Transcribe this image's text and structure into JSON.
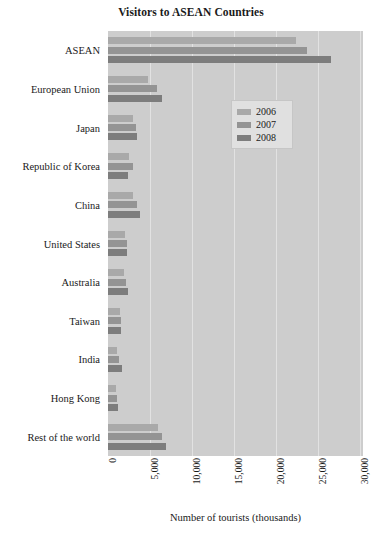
{
  "chart_data": {
    "type": "bar",
    "orientation": "horizontal",
    "title": "Visitors to ASEAN Countries",
    "xlabel": "Number of tourists (thousands)",
    "ylabel": "",
    "xlim": [
      0,
      30400
    ],
    "xticks": [
      "0",
      "5,000",
      "10,000",
      "15,000",
      "20,000",
      "25,000",
      "30,000"
    ],
    "xtick_values": [
      0,
      5000,
      10000,
      15000,
      20000,
      25000,
      30000
    ],
    "grid": true,
    "legend_position": "upper right",
    "categories": [
      "ASEAN",
      "European Union",
      "Japan",
      "Republic of Korea",
      "China",
      "United States",
      "Australia",
      "Taiwan",
      "India",
      "Hong Kong",
      "Rest of the world"
    ],
    "series": [
      {
        "name": "2006",
        "color": "#a9a9a9",
        "values": [
          22400,
          4800,
          3000,
          2500,
          3000,
          2000,
          1900,
          1400,
          1100,
          950,
          6000
        ]
      },
      {
        "name": "2007",
        "color": "#949494",
        "values": [
          23700,
          5850,
          3350,
          3000,
          3450,
          2250,
          2150,
          1600,
          1300,
          1100,
          6400
        ]
      },
      {
        "name": "2008",
        "color": "#7d7d7d",
        "values": [
          26600,
          6450,
          3500,
          2400,
          3800,
          2300,
          2400,
          1500,
          1650,
          1150,
          6900
        ]
      }
    ]
  },
  "legend": {
    "entries": [
      {
        "label": "2006",
        "color": "#a9a9a9"
      },
      {
        "label": "2007",
        "color": "#949494"
      },
      {
        "label": "2008",
        "color": "#7d7d7d"
      }
    ]
  },
  "colors": {
    "plot_background": "#cdcdcd",
    "gridline": "#e2e2e2",
    "legend_background": "#e0e0e0",
    "text": "#1a1a1a"
  }
}
